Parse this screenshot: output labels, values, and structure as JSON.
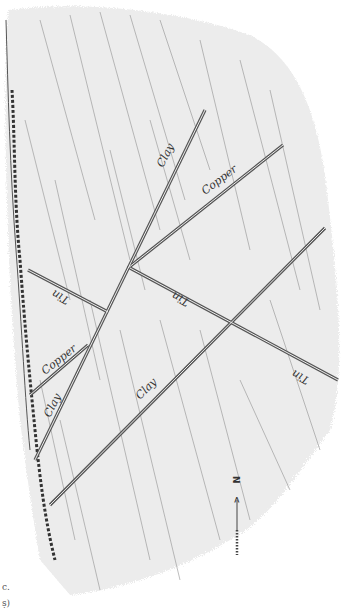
{
  "diagram": {
    "title": "",
    "background_color": "#ebebeb",
    "line_color": "#555555",
    "compass": {
      "label": "N",
      "arrow": "<"
    },
    "corner_marks": [
      "c.",
      "ṣ)"
    ],
    "veins": [
      {
        "id": "clay-upper",
        "label": "Clay",
        "x1": 205,
        "y1": 110,
        "x2": 35,
        "y2": 460,
        "lx": 163,
        "ly": 168,
        "angle": -63
      },
      {
        "id": "copper-upper",
        "label": "Copper",
        "x1": 283,
        "y1": 145,
        "x2": 128,
        "y2": 268,
        "lx": 210,
        "ly": 190,
        "angle": -37
      },
      {
        "id": "tin-left",
        "label": "Tin",
        "x1": 28,
        "y1": 270,
        "x2": 108,
        "y2": 312,
        "lx": 62,
        "ly": 298,
        "angle": 208
      },
      {
        "id": "tin-right",
        "label": "Tin",
        "x1": 130,
        "y1": 268,
        "x2": 338,
        "y2": 380,
        "lx": 180,
        "ly": 298,
        "angle": 208
      },
      {
        "id": "tin-far",
        "label": "Tin",
        "x1": 0,
        "y1": 0,
        "x2": 0,
        "y2": 0,
        "lx": 298,
        "ly": 375,
        "angle": 208
      },
      {
        "id": "clay-long",
        "label": "Clay",
        "x1": 325,
        "y1": 228,
        "x2": 50,
        "y2": 505,
        "lx": 150,
        "ly": 392,
        "angle": -45
      },
      {
        "id": "copper-lower",
        "label": "Copper",
        "x1": 88,
        "y1": 345,
        "x2": 30,
        "y2": 395,
        "lx": 58,
        "ly": 370,
        "angle": -38
      },
      {
        "id": "clay-lower-label",
        "label": "Clay",
        "x1": 0,
        "y1": 0,
        "x2": 0,
        "y2": 0,
        "lx": 50,
        "ly": 410,
        "angle": -63
      }
    ]
  }
}
